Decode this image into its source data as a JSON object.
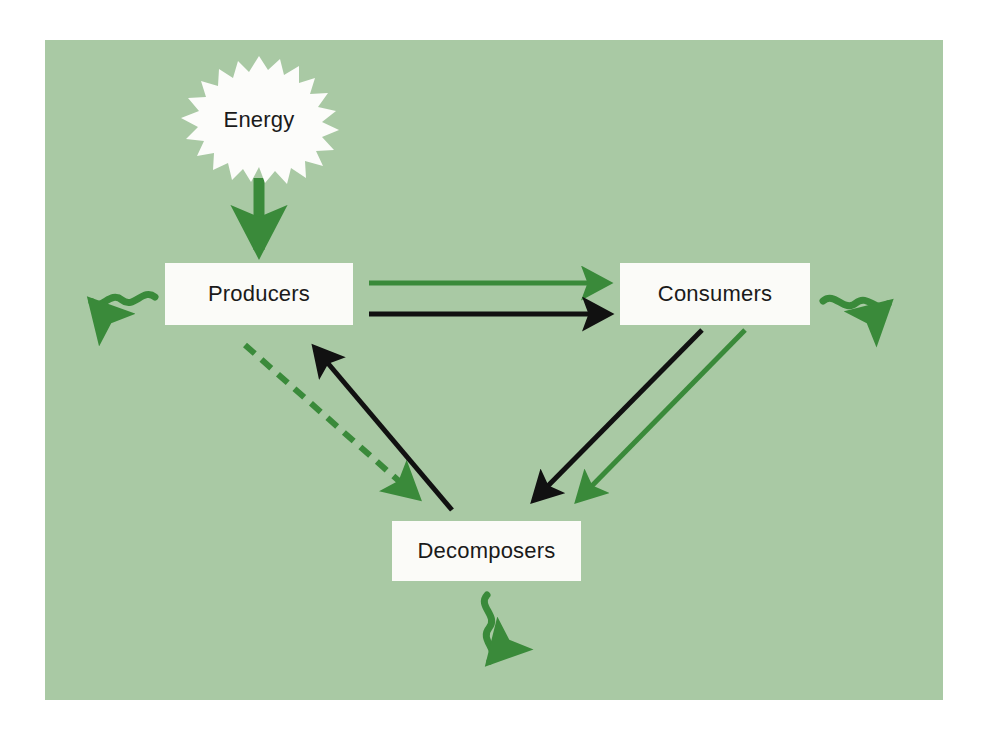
{
  "diagram": {
    "background_color": "#a9c9a4",
    "page_color": "#ffffff",
    "box_fill_color": "#fbfbf8",
    "energy_flow_color": "#3a8a3a",
    "nutrient_flow_color": "#111111",
    "nodes": {
      "energy": {
        "label": "Energy",
        "shape": "starburst"
      },
      "producers": {
        "label": "Producers",
        "shape": "rectangle"
      },
      "consumers": {
        "label": "Consumers",
        "shape": "rectangle"
      },
      "decomposers": {
        "label": "Decomposers",
        "shape": "rectangle"
      }
    },
    "connectors": [
      {
        "name": "energy-to-producers",
        "from": "Energy",
        "to": "Producers",
        "style": "solid-thick",
        "color": "#3a8a3a",
        "direction": "down"
      },
      {
        "name": "producers-to-consumers-energy",
        "from": "Producers",
        "to": "Consumers",
        "style": "solid",
        "color": "#3a8a3a",
        "direction": "right"
      },
      {
        "name": "producers-to-consumers-nutrients",
        "from": "Producers",
        "to": "Consumers",
        "style": "solid",
        "color": "#111111",
        "direction": "right"
      },
      {
        "name": "producers-to-decomposers-energy",
        "from": "Producers",
        "to": "Decomposers",
        "style": "dashed",
        "color": "#3a8a3a",
        "direction": "down-right"
      },
      {
        "name": "decomposers-to-producers-nutrients",
        "from": "Decomposers",
        "to": "Producers",
        "style": "solid",
        "color": "#111111",
        "direction": "up-left"
      },
      {
        "name": "consumers-to-decomposers-nutrients",
        "from": "Consumers",
        "to": "Decomposers",
        "style": "solid",
        "color": "#111111",
        "direction": "down-left"
      },
      {
        "name": "consumers-to-decomposers-energy",
        "from": "Consumers",
        "to": "Decomposers",
        "style": "solid",
        "color": "#3a8a3a",
        "direction": "down-left"
      },
      {
        "name": "producers-heat-loss",
        "from": "Producers",
        "to": "environment",
        "style": "wavy",
        "color": "#3a8a3a",
        "direction": "left"
      },
      {
        "name": "consumers-heat-loss",
        "from": "Consumers",
        "to": "environment",
        "style": "wavy",
        "color": "#3a8a3a",
        "direction": "right"
      },
      {
        "name": "decomposers-heat-loss",
        "from": "Decomposers",
        "to": "environment",
        "style": "wavy",
        "color": "#3a8a3a",
        "direction": "down"
      }
    ]
  }
}
